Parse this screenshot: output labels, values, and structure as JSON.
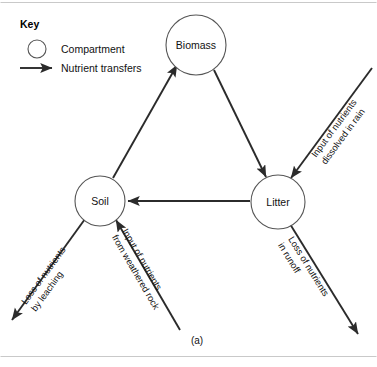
{
  "figure": {
    "caption": "(a)",
    "frame_color": "#c9c9c9",
    "line_color": "#2b2b2b",
    "circle_stroke_color": "#555555"
  },
  "key": {
    "title": "Key",
    "compartment_label": "Compartment",
    "transfer_label": "Nutrient transfers",
    "circle_icon": "circle-outline-icon",
    "arrow_icon": "arrow-right-icon"
  },
  "nodes": [
    {
      "id": "biomass",
      "label": "Biomass",
      "cx": 196,
      "cy": 45,
      "r": 30
    },
    {
      "id": "soil",
      "label": "Soil",
      "cx": 100,
      "cy": 201,
      "r": 25
    },
    {
      "id": "litter",
      "label": "Litter",
      "cx": 278,
      "cy": 202,
      "r": 27
    }
  ],
  "internal_transfers": [
    {
      "id": "soil-to-biomass",
      "from": "Soil",
      "to": "Biomass",
      "label": ""
    },
    {
      "id": "biomass-to-litter",
      "from": "Biomass",
      "to": "Litter",
      "label": ""
    },
    {
      "id": "litter-to-soil",
      "from": "Litter",
      "to": "Soil",
      "label": ""
    }
  ],
  "external_transfers": [
    {
      "id": "rain-input",
      "line1": "Input of nutrients",
      "line2": "dissolved in rain",
      "direction": "into-litter"
    },
    {
      "id": "leaching-loss",
      "line1": "Loss of nutrients",
      "line2": "by leaching",
      "direction": "out-of-soil"
    },
    {
      "id": "weathered-rock-input",
      "line1": "Input of nutrients",
      "line2": "from weathered rock",
      "direction": "into-soil"
    },
    {
      "id": "runoff-loss",
      "line1": "Loss of nutrients",
      "line2": "in runoff",
      "direction": "out-of-litter"
    }
  ]
}
